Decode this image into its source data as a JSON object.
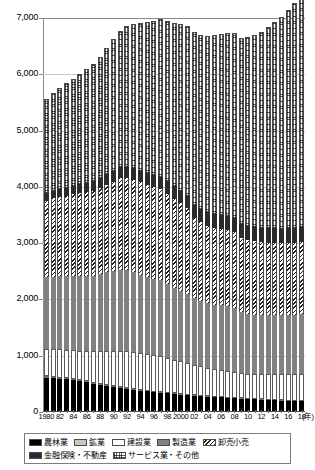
{
  "chart_data": {
    "type": "bar",
    "subtype": "stacked-vertical",
    "title": "",
    "xlabel": "(年)",
    "ylabel": "",
    "ylim": [
      0,
      7000
    ],
    "ytick_step": 1000,
    "ytick_labels": [
      "0",
      "1,000",
      "2,000",
      "3,000",
      "4,000",
      "5,000",
      "6,000",
      "7,000"
    ],
    "grid": true,
    "grid_axis": "y",
    "legend_position": "bottom",
    "x_unit_label": "(年)",
    "categories": [
      "1980",
      "81",
      "82",
      "83",
      "84",
      "85",
      "86",
      "87",
      "88",
      "89",
      "90",
      "91",
      "92",
      "93",
      "94",
      "95",
      "96",
      "97",
      "98",
      "99",
      "2000",
      "01",
      "02",
      "03",
      "04",
      "05",
      "06",
      "07",
      "08",
      "09",
      "10",
      "11",
      "12",
      "13",
      "14",
      "15",
      "16",
      "17",
      "18"
    ],
    "xtick_labels": [
      "1980",
      "82",
      "84",
      "86",
      "88",
      "90",
      "92",
      "94",
      "96",
      "98",
      "2000",
      "02",
      "04",
      "06",
      "08",
      "10",
      "12",
      "14",
      "16",
      "18"
    ],
    "series": [
      {
        "name": "農林業",
        "key": "agri",
        "pattern": "solid-black",
        "color": "#000000",
        "values": [
          610,
          600,
          590,
          580,
          565,
          545,
          525,
          500,
          480,
          460,
          440,
          425,
          410,
          395,
          380,
          365,
          350,
          340,
          330,
          320,
          310,
          300,
          290,
          280,
          272,
          265,
          258,
          250,
          243,
          236,
          230,
          224,
          218,
          213,
          208,
          203,
          199,
          195,
          192
        ]
      },
      {
        "name": "鉱業",
        "key": "mine",
        "pattern": "light-gray",
        "color": "#c6c6c6",
        "values": [
          25,
          24,
          23,
          22,
          21,
          20,
          19,
          18,
          17,
          16,
          15,
          15,
          14,
          14,
          13,
          13,
          12,
          12,
          11,
          11,
          10,
          10,
          9,
          9,
          8,
          8,
          8,
          7,
          7,
          7,
          6,
          6,
          6,
          6,
          5,
          5,
          5,
          5,
          5
        ]
      },
      {
        "name": "建設業",
        "key": "const",
        "pattern": "white-outline",
        "color": "#ffffff",
        "values": [
          480,
          492,
          500,
          505,
          515,
          525,
          540,
          560,
          580,
          605,
          630,
          650,
          660,
          665,
          660,
          655,
          650,
          640,
          620,
          600,
          580,
          560,
          540,
          520,
          500,
          490,
          480,
          470,
          460,
          450,
          445,
          450,
          455,
          460,
          465,
          470,
          475,
          480,
          485
        ]
      },
      {
        "name": "製造業",
        "key": "manu",
        "pattern": "mid-gray",
        "color": "#818181",
        "values": [
          1280,
          1290,
          1300,
          1305,
          1320,
          1335,
          1330,
          1340,
          1370,
          1400,
          1420,
          1440,
          1435,
          1410,
          1380,
          1360,
          1350,
          1350,
          1320,
          1280,
          1250,
          1220,
          1180,
          1160,
          1150,
          1145,
          1150,
          1155,
          1140,
          1080,
          1060,
          1050,
          1045,
          1040,
          1040,
          1040,
          1045,
          1050,
          1060
        ]
      },
      {
        "name": "卸売小売",
        "key": "whole",
        "pattern": "diagonal-hatch",
        "color": "#1d1d1d",
        "values": [
          1360,
          1390,
          1410,
          1430,
          1450,
          1470,
          1490,
          1510,
          1530,
          1560,
          1590,
          1620,
          1630,
          1640,
          1645,
          1640,
          1630,
          1620,
          1600,
          1580,
          1560,
          1530,
          1430,
          1400,
          1380,
          1370,
          1360,
          1350,
          1340,
          1320,
          1310,
          1300,
          1295,
          1290,
          1285,
          1280,
          1278,
          1275,
          1272
        ]
      },
      {
        "name": "金融保険・不動産",
        "key": "fin",
        "pattern": "dark-gray",
        "color": "#2b2b2b",
        "values": [
          130,
          135,
          140,
          145,
          150,
          155,
          162,
          170,
          178,
          186,
          195,
          200,
          205,
          208,
          210,
          212,
          214,
          216,
          218,
          220,
          222,
          224,
          228,
          232,
          236,
          240,
          244,
          248,
          250,
          250,
          252,
          254,
          256,
          258,
          260,
          262,
          264,
          266,
          268
        ]
      },
      {
        "name": "サービス業・その他",
        "key": "serv",
        "pattern": "fine-dot",
        "color": "#5f5f5f",
        "values": [
          1680,
          1730,
          1790,
          1850,
          1900,
          1960,
          2020,
          2090,
          2160,
          2240,
          2330,
          2420,
          2500,
          2560,
          2620,
          2680,
          2740,
          2800,
          2850,
          2900,
          2970,
          3010,
          3070,
          3100,
          3140,
          3180,
          3220,
          3260,
          3290,
          3310,
          3360,
          3420,
          3480,
          3570,
          3660,
          3760,
          3880,
          4000,
          4090
        ]
      }
    ],
    "totals": [
      5565,
      5661,
      5753,
      5837,
      5921,
      6010,
      6086,
      6188,
      6315,
      6467,
      6620,
      6770,
      6854,
      6892,
      6908,
      6925,
      6946,
      6978,
      6949,
      6911,
      6902,
      6854,
      6747,
      6701,
      6686,
      6698,
      6720,
      6740,
      6730,
      6653,
      6663,
      6704,
      6755,
      6837,
      6923,
      7020,
      7146,
      7271,
      7372
    ]
  },
  "legend": {
    "rows": [
      [
        {
          "label": "農林業",
          "key": "agri"
        },
        {
          "label": "鉱業",
          "key": "mine"
        },
        {
          "label": "建設業",
          "key": "const"
        },
        {
          "label": "製造業",
          "key": "manu"
        },
        {
          "label": "卸売小売",
          "key": "whole"
        }
      ],
      [
        {
          "label": "金融保険・不動産",
          "key": "fin"
        },
        {
          "label": "サービス業・その他",
          "key": "serv"
        }
      ]
    ]
  }
}
